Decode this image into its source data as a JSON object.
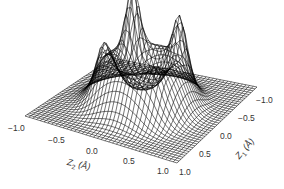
{
  "chart_data": {
    "type": "surface-wireframe",
    "title": "",
    "xlabel": "Z2 (Å)",
    "ylabel": "Z1 (Å)",
    "zlabel": "",
    "x_ticks": [
      "-1.0",
      "-0.5",
      "0.0",
      "0.5",
      "1.0"
    ],
    "y_ticks": [
      "-1.0",
      "-0.5",
      "0.0",
      "0.5",
      "1.0"
    ],
    "xlim": [
      -1.0,
      1.0
    ],
    "ylim": [
      -1.0,
      1.0
    ],
    "grid_resolution": 41,
    "mesh_color": "#000000",
    "background": "#ffffff"
  },
  "axes": {
    "z2": {
      "symbol": "Z",
      "sub": "2",
      "unit": "(Å)",
      "ticks": [
        "−1.0",
        "−0.5",
        "0.0",
        "0.5",
        "1.0"
      ]
    },
    "z1": {
      "symbol": "Z",
      "sub": "1",
      "unit": "(Å)",
      "ticks": [
        "1.0",
        "0.5",
        "0.0",
        "−0.5",
        "−1.0"
      ]
    }
  }
}
